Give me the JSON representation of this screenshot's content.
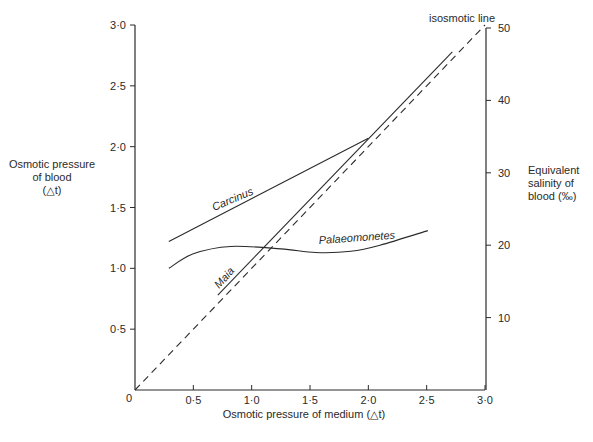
{
  "chart_data": {
    "type": "line",
    "title": "",
    "xlabel": "Osmotic pressure of medium (△t)",
    "ylabel": "Osmotic pressure of blood (△t)",
    "ylabel_lines": [
      "Osmotic pressure",
      "of blood",
      "(△t)"
    ],
    "y2label": "Equivalent salinity of blood (‰)",
    "y2label_lines": [
      "Equivalent",
      "salinity of",
      "blood (‰)"
    ],
    "xlim": [
      0,
      3.0
    ],
    "ylim": [
      0,
      3.0
    ],
    "y2lim": [
      0,
      50
    ],
    "grid": false,
    "origin_label": "0",
    "x_ticks": [
      "0·5",
      "1·0",
      "1·5",
      "2·0",
      "2·5",
      "3·0"
    ],
    "x_tick_values": [
      0.5,
      1.0,
      1.5,
      2.0,
      2.5,
      3.0
    ],
    "y_ticks": [
      "0·5",
      "1·0",
      "1·5",
      "2·0",
      "2·5",
      "3·0"
    ],
    "y_tick_values": [
      0.5,
      1.0,
      1.5,
      2.0,
      2.5,
      3.0
    ],
    "y2_ticks": [
      "10",
      "20",
      "30",
      "40",
      "50"
    ],
    "y2_tick_values": [
      10,
      20,
      30,
      40,
      50
    ],
    "series": [
      {
        "name": "Carcinus",
        "style": "solid",
        "x": [
          0.29,
          2.0
        ],
        "y": [
          1.22,
          2.07
        ]
      },
      {
        "name": "Maia",
        "style": "solid",
        "x": [
          0.71,
          2.72
        ],
        "y": [
          0.78,
          2.78
        ]
      },
      {
        "name": "Palaeomonetes",
        "style": "solid",
        "x": [
          0.29,
          0.5,
          0.82,
          1.25,
          1.55,
          1.85,
          2.1,
          2.51
        ],
        "y": [
          1.0,
          1.12,
          1.18,
          1.16,
          1.13,
          1.14,
          1.19,
          1.31
        ]
      },
      {
        "name": "isosmotic line",
        "style": "dashed",
        "x": [
          0,
          3.0
        ],
        "y": [
          0,
          3.0
        ]
      }
    ],
    "annotations": [
      {
        "text": "isosmotic line",
        "position": "top-right, end of dashed line"
      },
      {
        "text": "Carcinus",
        "position": "above Carcinus line"
      },
      {
        "text": "Maia",
        "position": "beside Maia line"
      },
      {
        "text": "Palaeomonetes",
        "position": "above Palaeomonetes curve"
      }
    ]
  }
}
